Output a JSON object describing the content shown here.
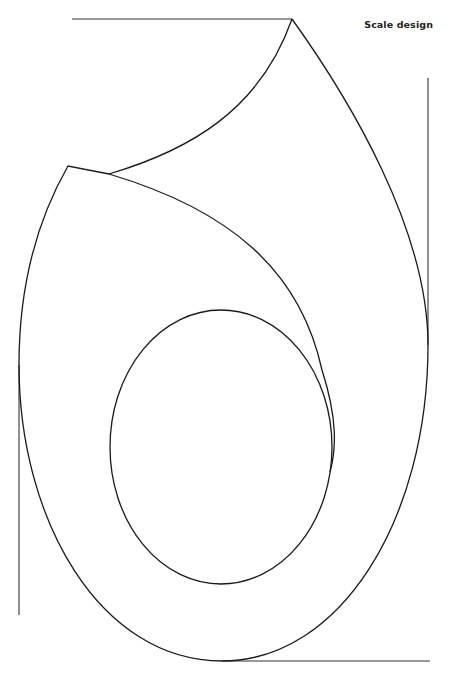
{
  "header": {
    "title": "Scale design"
  },
  "colors": {
    "stroke": "#1a1a1a",
    "background": "#ffffff"
  },
  "diagram": {
    "elements": [
      "top-guide-line",
      "right-guide-line",
      "left-guide-line",
      "bottom-guide-line",
      "outer-teardrop-outline",
      "upper-flap-curve",
      "inner-sweep-curve",
      "inner-ellipse"
    ]
  }
}
